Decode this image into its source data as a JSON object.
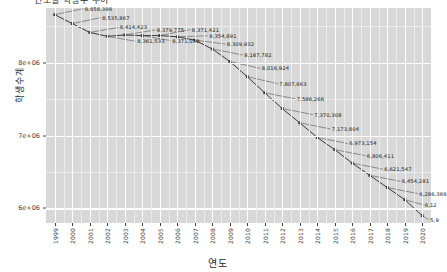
{
  "chart_title": "연도별 학생수 추이",
  "axis": {
    "x_label": "연도",
    "y_label": "학생수계",
    "y_ticks": [
      "6e+06",
      "7e+06",
      "8e+06"
    ],
    "x_ticks": [
      "1999",
      "2000",
      "2001",
      "2002",
      "2003",
      "2004",
      "2005",
      "2006",
      "2007",
      "2008",
      "2009",
      "2010",
      "2011",
      "2012",
      "2013",
      "2014",
      "2015",
      "2016",
      "2017",
      "2018",
      "2019",
      "2020"
    ]
  },
  "style": {
    "panel_bg": "#d8d8d8",
    "grid_major": "#ffffff",
    "grid_minor": "#ececec",
    "line_color": "#3a3a3a",
    "point_color": "#3a3a3a",
    "label_color": "#1a1a1a"
  },
  "chart_data": {
    "type": "line",
    "title": "연도별 학생수 추이",
    "xlabel": "연도",
    "ylabel": "학생수계",
    "ylim": [
      5800000,
      8750000
    ],
    "grid": true,
    "legend": "none",
    "categories": [
      "1999",
      "2000",
      "2001",
      "2002",
      "2003",
      "2004",
      "2005",
      "2006",
      "2007",
      "2008",
      "2009",
      "2010",
      "2011",
      "2012",
      "2013",
      "2014",
      "2015",
      "2016",
      "2017",
      "2018",
      "2019",
      "2020"
    ],
    "values": [
      8658398,
      8535867,
      8414423,
      8361533,
      8379775,
      8371030,
      8371421,
      8354891,
      8309932,
      8187782,
      8016924,
      7807663,
      7586266,
      7370308,
      7173804,
      6973154,
      6806411,
      6621547,
      6454281,
      6286368,
      6120000,
      5900000
    ],
    "data_labels": [
      "8,658,398",
      "8,535,867",
      "8,414,423",
      "8,361,533",
      "8,379,775",
      "8,371,030",
      "8,371,421",
      "8,354,891",
      "8,309,932",
      "8,187,782",
      "8,016,924",
      "7,807,663",
      "7,586,266",
      "7,370,308",
      "7,173,804",
      "6,973,154",
      "6,806,411",
      "6,621,547",
      "6,454,281",
      "6,286,368",
      "6,12",
      "5,9"
    ]
  }
}
